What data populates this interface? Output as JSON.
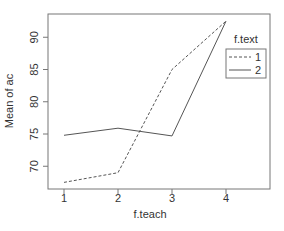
{
  "chart_data": {
    "type": "line",
    "title": "",
    "xlabel": "f.teach",
    "ylabel": "Mean of ac",
    "categories": [
      "1",
      "2",
      "3",
      "4"
    ],
    "yticks": [
      "70",
      "75",
      "80",
      "85",
      "90"
    ],
    "ylim": [
      66,
      94
    ],
    "series": [
      {
        "name": "1",
        "style": "dashed",
        "values": [
          67.5,
          69.0,
          85.0,
          92.5
        ]
      },
      {
        "name": "2",
        "style": "solid",
        "values": [
          74.8,
          75.9,
          74.7,
          92.5
        ]
      }
    ],
    "legend": {
      "title": "f.text",
      "position": "top-right inside",
      "entries": [
        "1",
        "2"
      ]
    },
    "grid": false
  },
  "colors": {
    "line": "#555555",
    "axis": "#777777"
  }
}
